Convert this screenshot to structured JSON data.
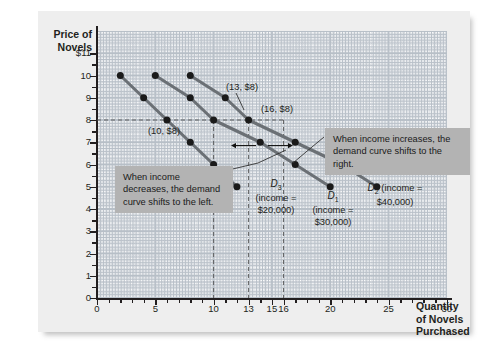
{
  "chart_data": {
    "type": "line",
    "title": "",
    "xlabel": "Quantity of Novels Purchased",
    "ylabel": "Price of Novels",
    "xlim": [
      0,
      31
    ],
    "ylim": [
      0,
      11.6
    ],
    "grid": true,
    "legend": "inline-curve-labels",
    "y_ticks": [
      "$11",
      "10",
      "9",
      "8",
      "7",
      "6",
      "5",
      "4",
      "3",
      "2",
      "1",
      "0"
    ],
    "y_tick_values": [
      11,
      10,
      9,
      8,
      7,
      6,
      5,
      4,
      3,
      2,
      1,
      0
    ],
    "x_ticks": [
      "0",
      "5",
      "10",
      "13",
      "15",
      "16",
      "20",
      "25",
      "30"
    ],
    "x_tick_values": [
      0,
      5,
      10,
      13,
      15,
      16,
      20,
      25,
      30
    ],
    "series": [
      {
        "name": "D3",
        "label": "D3",
        "income": "$20,000",
        "points": [
          [
            2,
            10
          ],
          [
            4,
            9
          ],
          [
            6,
            8
          ],
          [
            8,
            7
          ],
          [
            10,
            6
          ],
          [
            12,
            5
          ]
        ],
        "x": [
          2,
          4,
          6,
          8,
          10,
          12
        ],
        "values": [
          10,
          9,
          8,
          7,
          6,
          5
        ]
      },
      {
        "name": "D1",
        "label": "D1",
        "income": "$30,000",
        "points": [
          [
            5,
            10
          ],
          [
            8,
            9
          ],
          [
            10,
            8
          ],
          [
            14,
            7
          ],
          [
            17,
            6
          ],
          [
            20,
            5
          ]
        ],
        "x": [
          5,
          8,
          10,
          14,
          17,
          20
        ],
        "values": [
          10,
          9,
          8,
          7,
          6,
          5
        ]
      },
      {
        "name": "D2",
        "label": "D2",
        "income": "$40,000",
        "points": [
          [
            8,
            10
          ],
          [
            11,
            9
          ],
          [
            13,
            8
          ],
          [
            17,
            7
          ],
          [
            21,
            6
          ],
          [
            24,
            5
          ]
        ],
        "x": [
          8,
          11,
          13,
          17,
          21,
          24
        ],
        "values": [
          10,
          9,
          8,
          7,
          6,
          5
        ]
      }
    ],
    "annotated_points": [
      {
        "text": "(10, $8)",
        "x": 10,
        "y": 8
      },
      {
        "text": "(13, $8)",
        "x": 13,
        "y": 8
      },
      {
        "text": "(16, $8)",
        "x": 16,
        "y": 8
      }
    ],
    "reference_lines": {
      "horizontal": [
        8
      ],
      "vertical": [
        10,
        13,
        16
      ]
    },
    "annotations": [
      {
        "name": "income-decrease",
        "text": "When income decreases, the demand curve shifts to the left."
      },
      {
        "name": "income-increase",
        "text": "When income increases, the demand curve shifts to the right."
      }
    ]
  },
  "axis": {
    "y_title_line1": "Price of",
    "y_title_line2": "Novels",
    "x_title_line1": "Quantity",
    "x_title_line2": "of Novels",
    "x_title_line3": "Purchased"
  },
  "y_labels": [
    "$11",
    "10",
    "9",
    "8",
    "7",
    "6",
    "5",
    "4",
    "3",
    "2",
    "1",
    "0"
  ],
  "x_labels": [
    "0",
    "5",
    "10",
    "13",
    "15",
    "16",
    "20",
    "25",
    "30"
  ],
  "annotations": {
    "left_box": "When income decreases, the demand curve shifts to the left.",
    "right_box": "When income increases, the demand curve shifts to the right."
  },
  "point_labels": {
    "p1": "(10, $8)",
    "p2": "(13, $8)",
    "p3": "(16, $8)"
  },
  "curve_labels": {
    "d3_name": "D",
    "d3_sub": "3",
    "d3_income": "(income =",
    "d3_value": "$20,000)",
    "d1_name": "D",
    "d1_sub": "1",
    "d1_income": "(income =",
    "d1_value": "$30,000)",
    "d2_name": "D",
    "d2_sub": "2",
    "d2_income": "(income =",
    "d2_value": "$40,000)"
  },
  "colors": {
    "curve": "#6b7075",
    "point": "#1a1a1a",
    "annotation_bg": "#b3b3b3",
    "panel_bg": "#eeeeee",
    "grid": "#c9cfd6",
    "axis": "#231f20"
  }
}
